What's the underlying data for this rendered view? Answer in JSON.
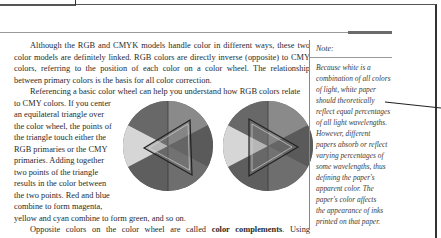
{
  "document": {
    "paragraphs": {
      "p1": "Although the RGB and CMYK models handle color in different ways, these two color models are definitely linked. RGB colors are directly inverse (opposite) to CMY colors, referring to the position of each color on a color wheel. The relationship between primary colors is the basis for all color correction.",
      "p2_lead": "Referencing a basic color wheel can help you understand how RGB colors relate",
      "p2_wrap_lines": [
        "to CMY colors. If you center",
        "an equilateral triangle over",
        "the color wheel, the points of",
        "the triangle touch either the",
        "RGB primaries or the CMY",
        "primaries. Adding together",
        "two points of the triangle",
        "results in the color between",
        "the two points. Red and blue",
        "combine to form magenta,"
      ],
      "p2_tail": "yellow and cyan combine to form green, and so on.",
      "p3_before": "Opposite colors on the color wheel are called ",
      "p3_bold": "color complements",
      "p3_after": ". Using subtractive color theory, a color's complement absorbs or subtracts that color from visible white light. For example, cyan is opposite red on the color wheel; cyan absorbs"
    },
    "figure": {
      "description": "Two grayscale color wheels with inscribed equilateral triangles",
      "wheel_colors": [
        "#6e6e6e",
        "#8a8a8a",
        "#5a5a5a",
        "#7b7b7b",
        "#d8d8d8",
        "#656565"
      ]
    },
    "note": {
      "title": "Note:",
      "lines": [
        "Because white is a",
        "combination of all colors",
        "of light, white paper",
        "should theoretically",
        "reflect equal percentages",
        "of all light wavelengths.",
        "However, different",
        "papers absorb or reflect",
        "varying percentages of",
        "some wavelengths, thus",
        "defining the paper's",
        "apparent color. The",
        "paper's color affects",
        "the appearance of inks",
        "printed on that paper."
      ]
    }
  }
}
